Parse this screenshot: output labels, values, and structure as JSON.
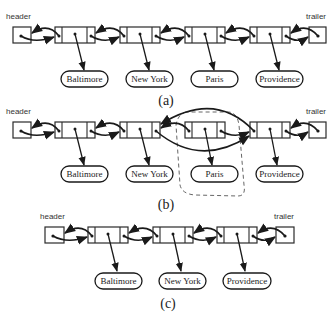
{
  "diagram": {
    "panels": [
      {
        "caption": "(a)",
        "header_label": "header",
        "trailer_label": "trailer",
        "elements": [
          "Baltimore",
          "New York",
          "Paris",
          "Providence"
        ]
      },
      {
        "caption": "(b)",
        "header_label": "header",
        "trailer_label": "trailer",
        "elements": [
          "Baltimore",
          "New York",
          "Paris",
          "Providence"
        ],
        "removed_element": "Paris",
        "note": "Paris node enclosed by dashed boundary; New York and Providence pointers relinked"
      },
      {
        "caption": "(c)",
        "header_label": "header",
        "trailer_label": "trailer",
        "elements": [
          "Baltimore",
          "New York",
          "Providence"
        ]
      }
    ]
  }
}
